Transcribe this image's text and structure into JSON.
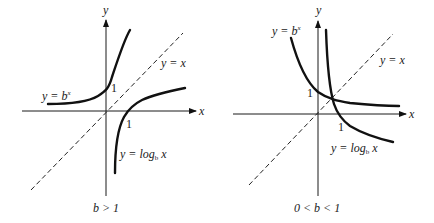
{
  "figure": {
    "panels": [
      {
        "id": "left",
        "caption": "b > 1",
        "axis_x_label": "x",
        "axis_y_label": "y",
        "exp_label_prefix": "y = b",
        "exp_label_sup": "x",
        "log_label_prefix": "y = log",
        "log_label_sub": "b",
        "log_label_suffix": " x",
        "identity_label": "y = x",
        "tick_x": "1",
        "tick_y": "1"
      },
      {
        "id": "right",
        "caption": "0 < b < 1",
        "axis_x_label": "x",
        "axis_y_label": "y",
        "exp_label_prefix": "y = b",
        "exp_label_sup": "x",
        "log_label_prefix": "y = log",
        "log_label_sub": "b",
        "log_label_suffix": " x",
        "identity_label": "y = x",
        "tick_x": "1",
        "tick_y": "1"
      }
    ]
  }
}
